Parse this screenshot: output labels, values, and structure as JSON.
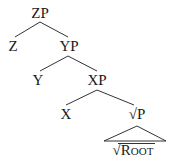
{
  "tree": {
    "nodes": [
      {
        "id": "zp",
        "label": "ZP",
        "x": 40,
        "y": 5
      },
      {
        "id": "z",
        "label": "Z",
        "x": 13,
        "y": 38
      },
      {
        "id": "yp",
        "label": "YP",
        "x": 68,
        "y": 38
      },
      {
        "id": "y",
        "label": "Y",
        "x": 38,
        "y": 72
      },
      {
        "id": "xp",
        "label": "XP",
        "x": 97,
        "y": 72
      },
      {
        "id": "x",
        "label": "X",
        "x": 66,
        "y": 106
      },
      {
        "id": "rootp",
        "label": "√P",
        "x": 137,
        "y": 106
      }
    ],
    "triangle_leaf": {
      "radical": "√",
      "first": "R",
      "rest": "OOT"
    },
    "edges": [
      [
        "zp",
        "z"
      ],
      [
        "zp",
        "yp"
      ],
      [
        "yp",
        "y"
      ],
      [
        "yp",
        "xp"
      ],
      [
        "xp",
        "x"
      ],
      [
        "xp",
        "rootp"
      ]
    ]
  }
}
